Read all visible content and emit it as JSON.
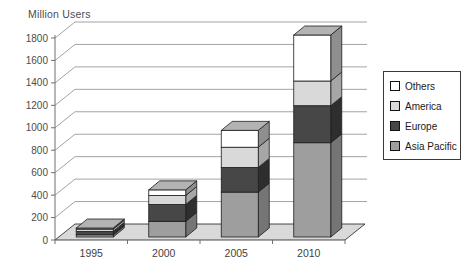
{
  "chart_data": {
    "type": "bar",
    "stacked": true,
    "projection": "3d",
    "title": "Million Users",
    "categories": [
      "1995",
      "2000",
      "2005",
      "2010"
    ],
    "series": [
      {
        "name": "Asia Pacific",
        "values": [
          20,
          140,
          400,
          840
        ],
        "front": "#9E9E9E",
        "side": "#757575",
        "top": "#8A8A8A"
      },
      {
        "name": "Europe",
        "values": [
          30,
          150,
          220,
          330
        ],
        "front": "#474747",
        "side": "#2E2E2E",
        "top": "#3C3C3C"
      },
      {
        "name": "America",
        "values": [
          20,
          80,
          180,
          220
        ],
        "front": "#D9D9D9",
        "side": "#A6A6A6",
        "top": "#C2C2C2"
      },
      {
        "name": "Others",
        "values": [
          10,
          50,
          150,
          410
        ],
        "front": "#FFFFFF",
        "side": "#8F8F8F",
        "top": "#B3B3B3"
      }
    ],
    "ylim": [
      0,
      1800
    ],
    "ytick_step": 200,
    "yticks": [
      0,
      200,
      400,
      600,
      800,
      1000,
      1200,
      1400,
      1600,
      1800
    ],
    "grid": true,
    "legend": {
      "position": "right",
      "order": [
        "Others",
        "America",
        "Europe",
        "Asia Pacific"
      ]
    },
    "colors": {
      "gridline": "#8c8c8c",
      "axis_line": "#707070",
      "axis_text": "#4d4d4d",
      "floor": "#D9D9D9",
      "outline": "#1c1c1c",
      "background": "#ffffff"
    }
  }
}
